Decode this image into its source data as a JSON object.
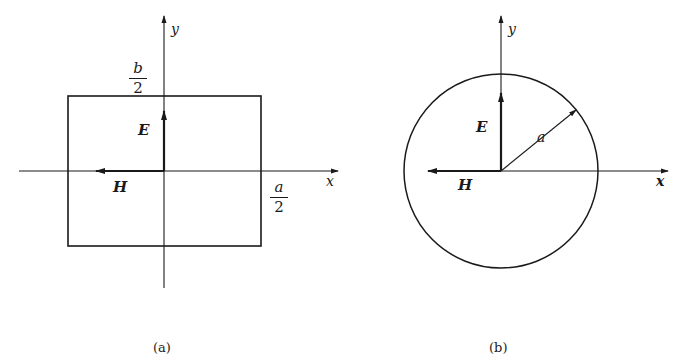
{
  "figure": {
    "panel_a": {
      "caption": "(a)",
      "shape": "rectangle",
      "axis_x_label": "x",
      "axis_y_label": "y",
      "field_e_label": "E",
      "field_h_label": "H",
      "dim_b": {
        "numerator": "b",
        "denominator": "2"
      },
      "dim_a": {
        "numerator": "a",
        "denominator": "2"
      }
    },
    "panel_b": {
      "caption": "(b)",
      "shape": "circle",
      "axis_x_label": "x",
      "axis_y_label": "y",
      "field_e_label": "E",
      "field_h_label": "H",
      "radius_label": "a"
    },
    "colors": {
      "stroke": "#1a1a1a",
      "background": "#ffffff"
    }
  }
}
